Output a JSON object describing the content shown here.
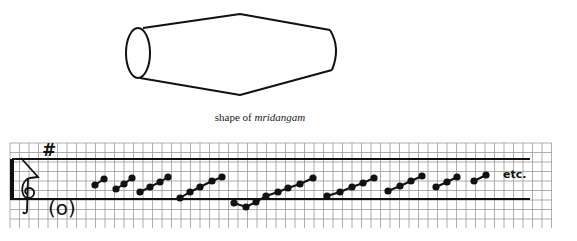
{
  "drum": {
    "name": "mridangam",
    "caption_prefix": "shape of ",
    "caption_italic": "mridangam"
  },
  "notation": {
    "key_signature": "#",
    "tonic_marker": "(o)",
    "continuation": "etc.",
    "staff_line_ys": [
      159,
      199
    ],
    "grid": {
      "x0": 10,
      "x1": 552,
      "y0": 143,
      "y1": 228,
      "step": 9.5
    },
    "groups": [
      [
        [
          95,
          185
        ],
        [
          104,
          179
        ]
      ],
      [
        [
          116,
          189
        ],
        [
          124,
          184
        ],
        [
          132,
          178
        ]
      ],
      [
        [
          140,
          192
        ],
        [
          150,
          187
        ],
        [
          160,
          182
        ],
        [
          168,
          177
        ]
      ],
      [
        [
          180,
          198
        ],
        [
          190,
          192
        ],
        [
          200,
          187
        ],
        [
          212,
          181
        ],
        [
          222,
          177
        ]
      ],
      [
        [
          234,
          203
        ],
        [
          246,
          207
        ],
        [
          256,
          202
        ],
        [
          266,
          196
        ],
        [
          278,
          192
        ],
        [
          288,
          188
        ],
        [
          300,
          184
        ],
        [
          313,
          178
        ]
      ],
      [
        [
          327,
          196
        ],
        [
          340,
          192
        ],
        [
          352,
          187
        ],
        [
          363,
          183
        ],
        [
          374,
          178
        ]
      ],
      [
        [
          388,
          191
        ],
        [
          400,
          186
        ],
        [
          411,
          181
        ],
        [
          422,
          176
        ]
      ],
      [
        [
          436,
          187
        ],
        [
          447,
          182
        ],
        [
          457,
          177
        ]
      ],
      [
        [
          474,
          181
        ],
        [
          486,
          175
        ]
      ]
    ]
  },
  "colors": {
    "ink": "#111111",
    "grid": "#9a9a9a",
    "paper": "#ffffff"
  }
}
